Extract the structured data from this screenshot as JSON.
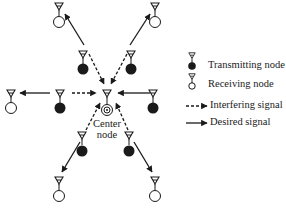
{
  "diagram": {
    "center_label_line1": "Center",
    "center_label_line2": "node",
    "legend": {
      "transmitting": "Transmitting node",
      "receiving": "Receiving node",
      "interfering": "Interfering signal",
      "desired": "Desired signal"
    },
    "icons": {
      "transmitting_node": "antenna-over-filled-circle",
      "receiving_node": "antenna-over-hollow-circle",
      "center_node": "antenna-over-double-circle"
    },
    "colors": {
      "stroke": "#1a1a1a",
      "background": "#ffffff"
    }
  }
}
